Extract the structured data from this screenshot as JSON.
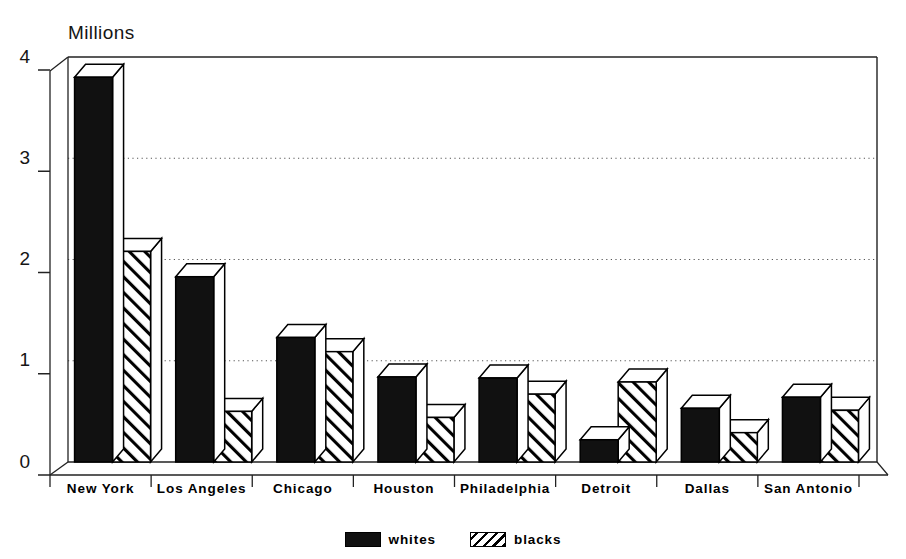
{
  "chart_data": {
    "type": "bar",
    "title": "",
    "ylabel": "Millions",
    "xlabel": "",
    "ylim": [
      0,
      4
    ],
    "yticks": [
      0,
      1,
      2,
      3,
      4
    ],
    "grid": "horizontal-dotted",
    "legend_position": "bottom-center",
    "style": "3d-bar",
    "categories": [
      "New York",
      "Los Angeles",
      "Chicago",
      "Houston",
      "Philadelphia",
      "Detroit",
      "Dallas",
      "San Antonio"
    ],
    "series": [
      {
        "name": "whites",
        "fill": "solid-black",
        "values": [
          3.8,
          1.83,
          1.23,
          0.84,
          0.83,
          0.22,
          0.53,
          0.64
        ]
      },
      {
        "name": "blacks",
        "fill": "diagonal-hatch",
        "values": [
          2.08,
          0.5,
          1.09,
          0.44,
          0.67,
          0.79,
          0.29,
          0.51
        ]
      }
    ]
  },
  "axis": {
    "title": "Millions",
    "ytick_labels": [
      "0",
      "1",
      "2",
      "3",
      "4"
    ],
    "xtick_labels": [
      "New York",
      "Los Angeles",
      "Chicago",
      "Houston",
      "Philadelphia",
      "Detroit",
      "Dallas",
      "San Antonio"
    ]
  },
  "legend": {
    "items": [
      {
        "label": "whites",
        "swatch": "solid-black-swatch"
      },
      {
        "label": "blacks",
        "swatch": "diagonal-hatch-swatch"
      }
    ]
  },
  "colors": {
    "series_whites": "#111111",
    "series_blacks": "#ffffff",
    "outline": "#000000",
    "gridline": "#555555",
    "background": "#ffffff"
  }
}
